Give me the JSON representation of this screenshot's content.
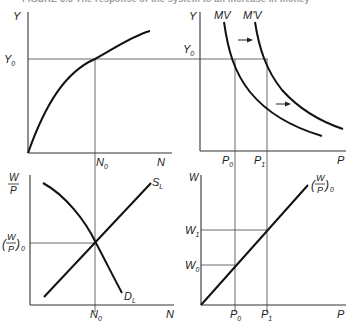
{
  "caption": "FIGURE 8.8  The response of the system to an increase in money",
  "panels": {
    "production": {
      "y_label": "Y",
      "x_label": "N",
      "y_tick": "Y",
      "y_tick_sub": "0",
      "x_tick": "N",
      "x_tick_sub": "0",
      "curve": "production function Y = F(N)"
    },
    "aggregate_demand": {
      "y_label": "Y",
      "x_label": "P",
      "y_tick": "Y",
      "y_tick_sub": "0",
      "curve1_label": "MV",
      "curve2_label": "M'V",
      "x_tick0": "P",
      "x_tick0_sub": "0",
      "x_tick1": "P",
      "x_tick1_sub": "1",
      "shift_arrows": "right"
    },
    "labor_market": {
      "y_label_num": "W",
      "y_label_den": "P",
      "x_label": "N",
      "y_tick_num": "W",
      "y_tick_den": "P",
      "y_tick_sub": "0",
      "x_tick": "N",
      "x_tick_sub": "0",
      "supply_label": "S",
      "supply_sub": "L",
      "demand_label": "D",
      "demand_sub": "L"
    },
    "wage_price": {
      "y_label": "W",
      "x_label": "P",
      "line_label_num": "W",
      "line_label_den": "P",
      "line_label_sub": "0",
      "y_tick0": "W",
      "y_tick0_sub": "0",
      "y_tick1": "W",
      "y_tick1_sub": "1",
      "x_tick0": "P",
      "x_tick0_sub": "0",
      "x_tick1": "P",
      "x_tick1_sub": "1"
    }
  }
}
